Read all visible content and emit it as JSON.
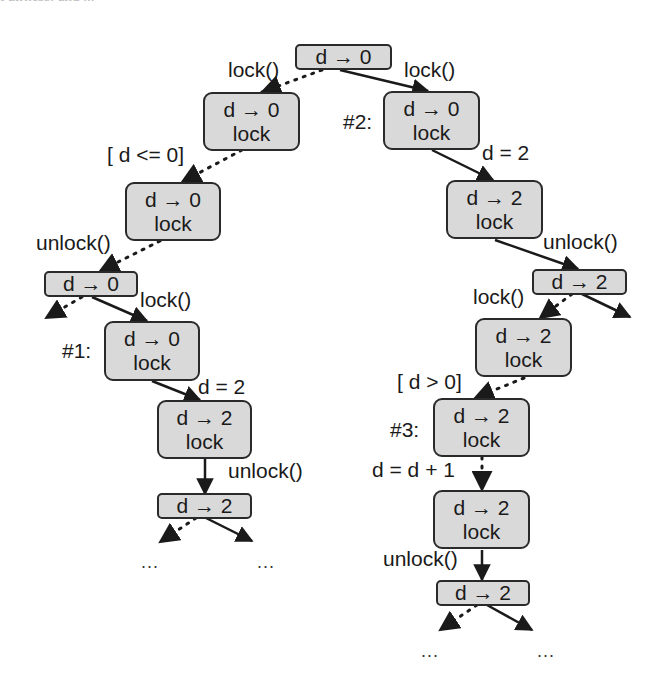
{
  "header_fragment": "Fairness: and ...",
  "nodes": {
    "root": {
      "state": "d → 0"
    },
    "l1": {
      "state": "d → 0",
      "lock": "lock"
    },
    "l2": {
      "state": "d → 0",
      "lock": "lock"
    },
    "l3": {
      "state": "d → 0"
    },
    "l4": {
      "state": "d → 0",
      "lock": "lock",
      "tag": "#1:"
    },
    "l5": {
      "state": "d → 2",
      "lock": "lock"
    },
    "l6": {
      "state": "d → 2"
    },
    "r1": {
      "state": "d → 0",
      "lock": "lock",
      "tag": "#2:"
    },
    "r2": {
      "state": "d → 2",
      "lock": "lock"
    },
    "r3": {
      "state": "d → 2"
    },
    "r4": {
      "state": "d → 2",
      "lock": "lock"
    },
    "r5": {
      "state": "d → 2",
      "lock": "lock",
      "tag": "#3:"
    },
    "r6": {
      "state": "d → 2",
      "lock": "lock"
    },
    "r7": {
      "state": "d → 2"
    }
  },
  "edges": {
    "root_l1": "lock()",
    "root_r1": "lock()",
    "l1_l2": "[ d <= 0]",
    "l2_l3": "unlock()",
    "l3_l4": "lock()",
    "l4_l5": "d = 2",
    "l5_l6": "unlock()",
    "r1_r2": "d = 2",
    "r2_r3": "unlock()",
    "r3_r4": "lock()",
    "r4_r5": "[ d > 0]",
    "r5_r6": "d = d + 1",
    "r6_r7": "unlock()"
  },
  "ellipses": {
    "l_left": "...",
    "l_right": "...",
    "r_left": "...",
    "r_right": "..."
  },
  "legend": {
    "solid_edge": "scheduled transition",
    "dotted_edge": "alternative transition"
  },
  "colors": {
    "node_fill": "#d9d9d9",
    "node_border": "#2a2a2a",
    "edge": "#1a1a1a"
  }
}
